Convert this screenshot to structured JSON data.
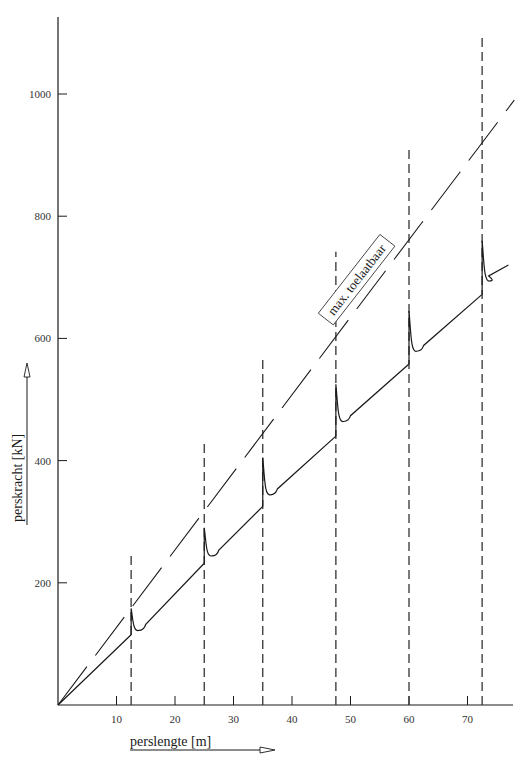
{
  "chart_data": {
    "type": "line",
    "title": "",
    "xlabel": "perslengte [m]",
    "ylabel": "perskracht [kN]",
    "xlim": [
      0,
      78
    ],
    "ylim": [
      0,
      1120
    ],
    "x_ticks": [
      10,
      20,
      30,
      40,
      50,
      60,
      70
    ],
    "x_tick_labels": [
      "10",
      "20",
      "30",
      "40",
      "50",
      "60",
      "70"
    ],
    "y_ticks": [
      200,
      400,
      600,
      800,
      1000
    ],
    "y_tick_labels": [
      "200",
      "400",
      "600",
      "800",
      "1000"
    ],
    "grid": false,
    "legend": null,
    "annotations": [
      {
        "text": "max. toelaatbaar",
        "boxed": true,
        "rotation_deg": -52,
        "x": 51,
        "y": 700
      }
    ],
    "vertical_dashed_lines": [
      {
        "x": 12.5,
        "y_top": 250
      },
      {
        "x": 25,
        "y_top": 428
      },
      {
        "x": 35,
        "y_top": 568
      },
      {
        "x": 47.5,
        "y_top": 742
      },
      {
        "x": 60,
        "y_top": 915
      },
      {
        "x": 72.5,
        "y_top": 1093
      }
    ],
    "series": [
      {
        "name": "max. toelaatbaar",
        "style": "dash-dot (long dashes)",
        "points": [
          [
            0,
            0
          ],
          [
            78,
            990
          ]
        ]
      },
      {
        "name": "perskracht",
        "style": "solid sawtooth",
        "segments": [
          {
            "x_start": 0,
            "x_end": 12.5,
            "y_start": 0,
            "y_end": 115,
            "spike_peak": 158,
            "trough": 128
          },
          {
            "x_start": 12.5,
            "x_end": 25,
            "y_start": 128,
            "y_end": 232,
            "spike_peak": 290,
            "trough": 250
          },
          {
            "x_start": 25,
            "x_end": 35,
            "y_start": 250,
            "y_end": 325,
            "spike_peak": 405,
            "trough": 350
          },
          {
            "x_start": 35,
            "x_end": 47.5,
            "y_start": 350,
            "y_end": 440,
            "spike_peak": 525,
            "trough": 470
          },
          {
            "x_start": 47.5,
            "x_end": 60,
            "y_start": 470,
            "y_end": 558,
            "spike_peak": 645,
            "trough": 585
          },
          {
            "x_start": 60,
            "x_end": 72.5,
            "y_start": 585,
            "y_end": 672,
            "spike_peak": 760,
            "trough": 700
          },
          {
            "x_start": 72.5,
            "x_end": 77,
            "y_start": 700,
            "y_end": 720
          }
        ]
      }
    ]
  },
  "labels": {
    "x_axis": "perslengte [m]",
    "y_axis": "perskracht [kN]",
    "annotation": "max. toelaatbaar"
  },
  "colors": {
    "line": "#1a1a1a",
    "dashed": "#333333",
    "background": "#ffffff"
  }
}
